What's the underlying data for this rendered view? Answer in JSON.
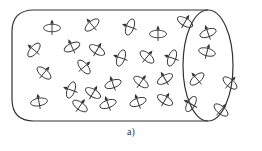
{
  "figure": {
    "caption": "a)",
    "stroke_color": "#333333",
    "background": "#ffffff",
    "cylinder": {
      "top_y": 10,
      "bottom_y": 121,
      "left_x": 12,
      "corner_radius": 22,
      "end_ellipse": {
        "cx": 208,
        "cy": 65.5,
        "rx": 25,
        "ry": 55.5
      }
    },
    "spins": [
      {
        "x": 52,
        "y": 28,
        "angle": 0,
        "arrow": "up"
      },
      {
        "x": 92,
        "y": 25,
        "angle": -40,
        "arrow": "down-right"
      },
      {
        "x": 130,
        "y": 27,
        "angle": -70,
        "arrow": "left"
      },
      {
        "x": 158,
        "y": 34,
        "angle": 0,
        "arrow": "up"
      },
      {
        "x": 185,
        "y": 22,
        "angle": 30,
        "arrow": "up"
      },
      {
        "x": 208,
        "y": 33,
        "angle": -20,
        "arrow": "left"
      },
      {
        "x": 207,
        "y": 52,
        "angle": 15,
        "arrow": "down"
      },
      {
        "x": 34,
        "y": 50,
        "angle": -50,
        "arrow": "up-left"
      },
      {
        "x": 72,
        "y": 47,
        "angle": -25,
        "arrow": "up"
      },
      {
        "x": 97,
        "y": 50,
        "angle": 30,
        "arrow": "up"
      },
      {
        "x": 121,
        "y": 58,
        "angle": -70,
        "arrow": "right"
      },
      {
        "x": 147,
        "y": 57,
        "angle": 40,
        "arrow": "up-left"
      },
      {
        "x": 172,
        "y": 58,
        "angle": -70,
        "arrow": "left"
      },
      {
        "x": 44,
        "y": 73,
        "angle": 40,
        "arrow": "up"
      },
      {
        "x": 84,
        "y": 67,
        "angle": 50,
        "arrow": "left"
      },
      {
        "x": 113,
        "y": 84,
        "angle": -20,
        "arrow": "up"
      },
      {
        "x": 141,
        "y": 82,
        "angle": 35,
        "arrow": "left"
      },
      {
        "x": 165,
        "y": 79,
        "angle": -30,
        "arrow": "down"
      },
      {
        "x": 197,
        "y": 79,
        "angle": -40,
        "arrow": "left"
      },
      {
        "x": 230,
        "y": 83,
        "angle": 40,
        "arrow": "down-left"
      },
      {
        "x": 71,
        "y": 90,
        "angle": -70,
        "arrow": "left"
      },
      {
        "x": 93,
        "y": 93,
        "angle": 30,
        "arrow": "up"
      },
      {
        "x": 138,
        "y": 102,
        "angle": -20,
        "arrow": "up"
      },
      {
        "x": 39,
        "y": 102,
        "angle": -10,
        "arrow": "up"
      },
      {
        "x": 80,
        "y": 106,
        "angle": 35,
        "arrow": "up-right"
      },
      {
        "x": 108,
        "y": 104,
        "angle": -20,
        "arrow": "up"
      },
      {
        "x": 165,
        "y": 100,
        "angle": 30,
        "arrow": "up"
      },
      {
        "x": 191,
        "y": 104,
        "angle": -60,
        "arrow": "right"
      },
      {
        "x": 221,
        "y": 110,
        "angle": 40,
        "arrow": "left"
      },
      {
        "x": 57,
        "y": 88,
        "angle": 0,
        "arrow": "none"
      }
    ]
  }
}
